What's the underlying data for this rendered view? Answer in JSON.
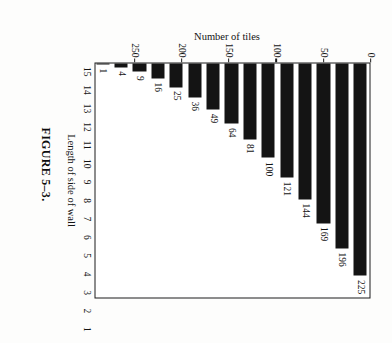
{
  "caption": "FIGURE 5–3.",
  "rotation_note": "figure printed sideways on the page (rotated 90°)",
  "chart_data": {
    "type": "bar",
    "orientation": "horizontal",
    "title": "",
    "xlabel": "Length of side of wall",
    "ylabel": "Number of tiles",
    "categories": [
      "1",
      "2",
      "3",
      "4",
      "5",
      "6",
      "7",
      "8",
      "9",
      "10",
      "11",
      "12",
      "13",
      "14",
      "15"
    ],
    "values": [
      1,
      4,
      9,
      16,
      25,
      36,
      49,
      64,
      81,
      100,
      121,
      144,
      169,
      196,
      225
    ],
    "data_labels": [
      "1",
      "4",
      "9",
      "16",
      "25",
      "36",
      "49",
      "64",
      "81",
      "100",
      "121",
      "144",
      "169",
      "196",
      "225"
    ],
    "value_axis_ticks": [
      0,
      50,
      100,
      150,
      200,
      250
    ],
    "value_axis_tick_labels": [
      "0",
      "50",
      "100",
      "150",
      "200",
      "250"
    ],
    "ylim": [
      0,
      250
    ],
    "grid": false,
    "legend": false,
    "bar_color": "#141414",
    "frame_color": "#1a1a1a"
  }
}
